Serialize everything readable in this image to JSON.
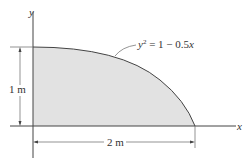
{
  "diagram": {
    "axes": {
      "x_label": "x",
      "y_label": "y"
    },
    "curve": {
      "equation_lhs": "y",
      "equation_exp": "2",
      "equation_rhs": " = 1 − 0.5",
      "equation_var": "x"
    },
    "dimensions": {
      "height": "1 m",
      "width": "2 m"
    },
    "colors": {
      "fill": "#e2e2e2",
      "line": "#444444",
      "text": "#333333"
    }
  }
}
